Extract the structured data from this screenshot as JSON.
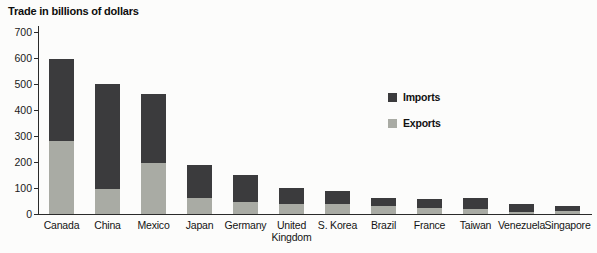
{
  "title": "Trade in billions of dollars",
  "chart_data": {
    "type": "bar",
    "stacked": true,
    "title": "Trade in billions of dollars",
    "xlabel": "",
    "ylabel": "Trade in billions of dollars",
    "ylim": [
      0,
      700
    ],
    "yticks": [
      0,
      100,
      200,
      300,
      400,
      500,
      600,
      700
    ],
    "grid": false,
    "legend_position": "center-right",
    "categories": [
      "Canada",
      "China",
      "Mexico",
      "Japan",
      "Germany",
      "United Kingdom",
      "S. Korea",
      "Brazil",
      "France",
      "Taiwan",
      "Venezuela",
      "Singapore"
    ],
    "series": [
      {
        "name": "Exports",
        "color": "#a9aba4",
        "values": [
          280,
          95,
          195,
          60,
          45,
          40,
          40,
          30,
          23,
          20,
          7,
          11
        ]
      },
      {
        "name": "Imports",
        "color": "#3b3b3d",
        "values": [
          315,
          405,
          265,
          130,
          105,
          60,
          50,
          33,
          35,
          40,
          33,
          21
        ]
      }
    ],
    "legend": [
      {
        "label": "Imports",
        "color": "#3b3b3d"
      },
      {
        "label": "Exports",
        "color": "#a9aba4"
      }
    ]
  }
}
